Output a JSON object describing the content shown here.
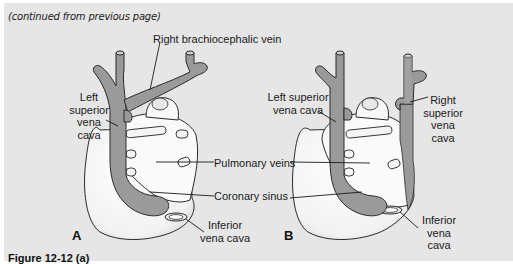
{
  "page": {
    "continued_note": "(continued from previous page)",
    "figure_caption_partial": "Figure 12-12 (a)"
  },
  "figure": {
    "panels": [
      {
        "letter": "A",
        "labels": {
          "right_brachiocephalic_vein": "Right brachiocephalic vein",
          "left_svc_line1": "Left",
          "left_svc_line2": "superior",
          "left_svc_line3": "vena",
          "left_svc_line4": "cava",
          "inferior_vc_line1": "Inferior",
          "inferior_vc_line2": "vena cava"
        }
      },
      {
        "letter": "B",
        "labels": {
          "left_svc_line1": "Left superior",
          "left_svc_line2": "vena cava",
          "right_svc_line1": "Right",
          "right_svc_line2": "superior",
          "right_svc_line3": "vena",
          "right_svc_line4": "cava",
          "inferior_vc_line1": "Inferior",
          "inferior_vc_line2": "vena",
          "inferior_vc_line3": "cava"
        }
      }
    ],
    "shared_labels": {
      "pulmonary_veins": "Pulmonary veins",
      "coronary_sinus": "Coronary sinus"
    }
  },
  "colors": {
    "background": "#e6e6e6",
    "vein_fill": "#9a9a9a",
    "heart_fill": "#f7f7f7",
    "outline": "#2a2a2a"
  }
}
